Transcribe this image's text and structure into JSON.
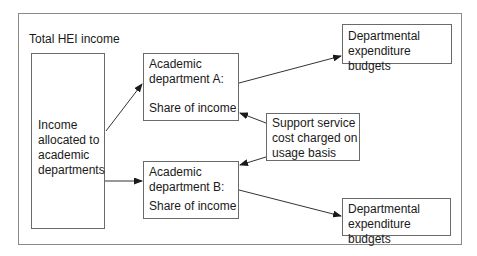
{
  "diagram": {
    "title": "Total HEI income",
    "source_box": {
      "lines": [
        "Income",
        "allocated to",
        "academic",
        "departments"
      ]
    },
    "dept_a": {
      "lines": [
        "Academic",
        "department A:"
      ],
      "share": "Share of income"
    },
    "dept_b": {
      "lines": [
        "Academic",
        "department B:"
      ],
      "share": "Share of income"
    },
    "support": {
      "lines": [
        "Support service",
        "cost charged on",
        "usage basis"
      ]
    },
    "budget_top": {
      "lines": [
        "Departmental",
        "expenditure budgets"
      ]
    },
    "budget_bottom": {
      "lines": [
        "Departmental",
        "expenditure budgets"
      ]
    },
    "edges": [
      {
        "from": "source_box",
        "to": "dept_a"
      },
      {
        "from": "source_box",
        "to": "dept_b"
      },
      {
        "from": "dept_a",
        "to": "budget_top"
      },
      {
        "from": "dept_b",
        "to": "budget_bottom"
      },
      {
        "from": "support",
        "to": "dept_a"
      },
      {
        "from": "support",
        "to": "dept_b"
      }
    ]
  }
}
